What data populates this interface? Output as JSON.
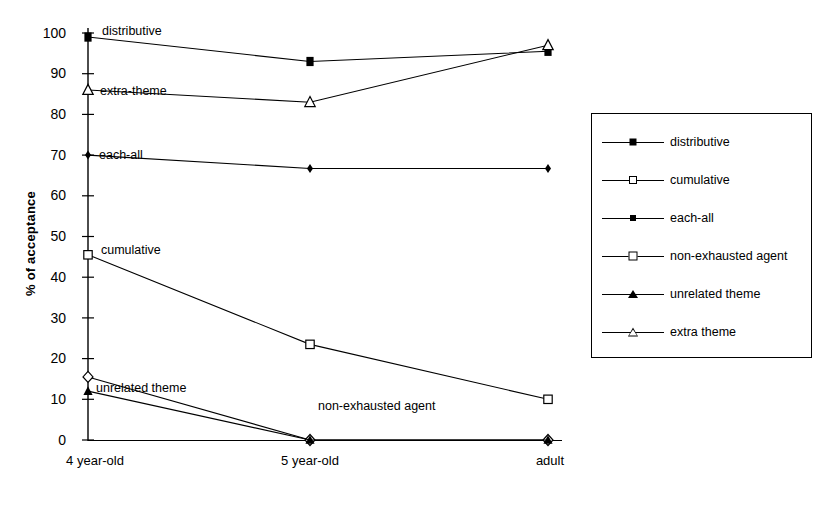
{
  "chart_data": {
    "type": "line",
    "title": "",
    "xlabel": "",
    "ylabel": "% of acceptance",
    "categories": [
      "4 year-old",
      "5 year-old",
      "adult"
    ],
    "ylim": [
      0,
      100
    ],
    "yticks": [
      "0",
      "10",
      "20",
      "30",
      "40",
      "50",
      "60",
      "70",
      "80",
      "90",
      "100"
    ],
    "grid": false,
    "legend_position": "right",
    "series": [
      {
        "name": "distributive",
        "marker": "filled-square",
        "values": [
          99,
          93,
          95.5
        ]
      },
      {
        "name": "cumulative",
        "marker": "open-square",
        "values": [
          45.5,
          23.5,
          10
        ]
      },
      {
        "name": "each-all",
        "marker": "filled-diamond",
        "values": [
          70,
          66.7,
          66.7
        ]
      },
      {
        "name": "non-exhausted agent",
        "marker": "open-diamond",
        "values": [
          15.5,
          0,
          0
        ]
      },
      {
        "name": "unrelated theme",
        "marker": "filled-triangle",
        "values": [
          12,
          0,
          0
        ]
      },
      {
        "name": "extra theme",
        "marker": "open-triangle",
        "values": [
          86,
          83,
          97
        ]
      }
    ],
    "annotations": [
      {
        "text": "distributive",
        "x": "4 year-old",
        "y": 99
      },
      {
        "text": "extra-theme",
        "x": "4 year-old",
        "y": 86
      },
      {
        "text": "each-all",
        "x": "4 year-old",
        "y": 70
      },
      {
        "text": "cumulative",
        "x": "4 year-old",
        "y": 45.5
      },
      {
        "text": "unrelated theme",
        "x": "4 year-old",
        "y": 12
      },
      {
        "text": "non-exhausted agent",
        "x": "5 year-old",
        "y": 7
      }
    ]
  },
  "legend": {
    "entries": [
      {
        "label": "distributive",
        "marker": "filled-square"
      },
      {
        "label": "cumulative",
        "marker": "open-square"
      },
      {
        "label": "each-all",
        "marker": "filled-diamond"
      },
      {
        "label": "non-exhausted agent",
        "marker": "open-diamond"
      },
      {
        "label": "unrelated theme",
        "marker": "filled-triangle"
      },
      {
        "label": "extra theme",
        "marker": "open-triangle"
      }
    ]
  },
  "colors": {
    "line": "#000000",
    "axis": "#000000",
    "background": "#ffffff"
  }
}
